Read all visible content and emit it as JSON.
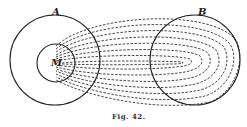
{
  "labels": {
    "a": "A",
    "b": "B",
    "m": "M"
  },
  "caption": "Fig. 42.",
  "colors": {
    "stroke": "#222222",
    "background": "#ffffff"
  }
}
